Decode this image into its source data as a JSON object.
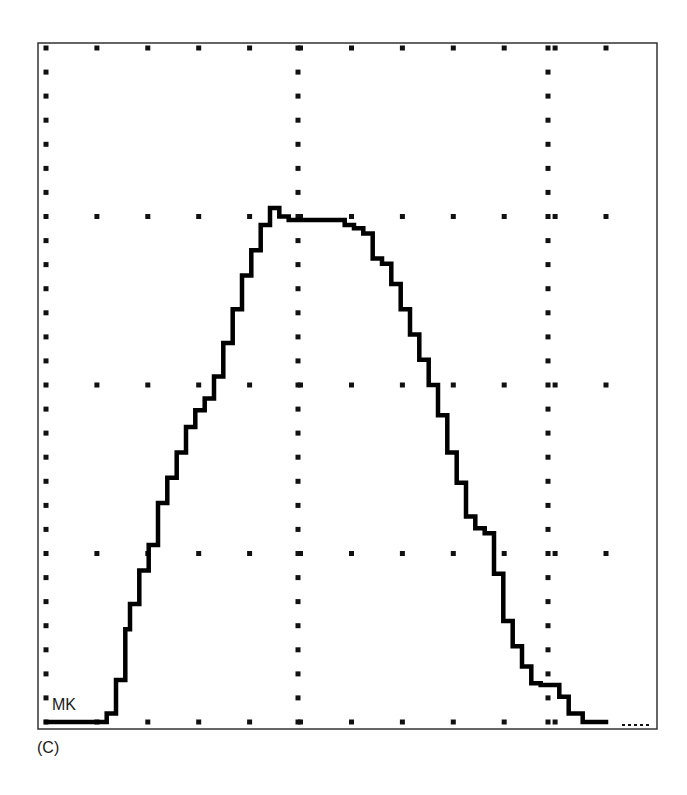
{
  "figure": {
    "panel_label": "(C)",
    "trace_label": "MK"
  },
  "colors": {
    "frame": "#333333",
    "grid_dots": "#111111",
    "trace": "#000000",
    "background": "#ffffff"
  },
  "chart_data": {
    "type": "line",
    "title": "",
    "xlabel": "",
    "ylabel": "",
    "annotations": [
      "MK",
      "(C)"
    ],
    "grid": "dotted",
    "legend": "none",
    "axis_units": "divisions (unlabeled)",
    "xlim": [
      0,
      12
    ],
    "ylim": [
      0,
      4
    ],
    "major_x_gridlines": [
      0,
      5,
      10
    ],
    "major_y_gridlines": [
      0,
      1,
      2,
      3,
      4
    ],
    "series": [
      {
        "name": "MK",
        "x": [
          0,
          1.2,
          1.3,
          1.5,
          1.7,
          1.8,
          2.0,
          2.2,
          2.4,
          2.6,
          2.8,
          3.0,
          3.2,
          3.4,
          3.6,
          3.8,
          4.0,
          4.2,
          4.4,
          4.6,
          4.8,
          5.0,
          5.2,
          5.4,
          5.6,
          5.8,
          6.0,
          6.2,
          6.4,
          6.6,
          6.8,
          7.0,
          7.2,
          7.4,
          7.6,
          7.8,
          8.0,
          8.2,
          8.4,
          8.6,
          8.8,
          9.0,
          9.2,
          9.4,
          9.6,
          9.8,
          10.0,
          10.2,
          10.4,
          10.6,
          10.8,
          11.0,
          11.2,
          11.5,
          12.0
        ],
        "y": [
          0.0,
          0.0,
          0.05,
          0.25,
          0.55,
          0.7,
          0.9,
          1.05,
          1.3,
          1.45,
          1.6,
          1.75,
          1.85,
          1.92,
          2.05,
          2.25,
          2.45,
          2.65,
          2.8,
          2.95,
          3.05,
          3.0,
          2.98,
          2.98,
          2.98,
          2.98,
          2.98,
          2.98,
          2.95,
          2.93,
          2.9,
          2.75,
          2.72,
          2.6,
          2.45,
          2.3,
          2.15,
          2.0,
          1.82,
          1.6,
          1.42,
          1.22,
          1.15,
          1.12,
          0.88,
          0.6,
          0.45,
          0.33,
          0.23,
          0.22,
          0.22,
          0.15,
          0.05,
          0.0,
          0.0
        ]
      }
    ]
  }
}
